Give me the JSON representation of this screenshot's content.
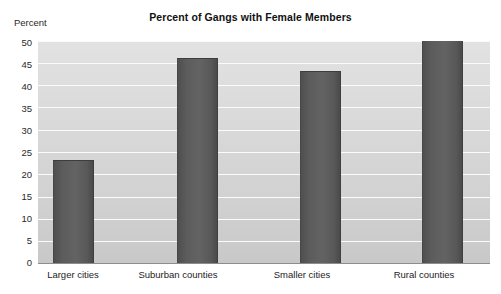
{
  "chart_data": {
    "type": "bar",
    "title": "Percent of Gangs with Female Members",
    "xlabel": "",
    "ylabel": "Percent",
    "categories": [
      "Larger cities",
      "Suburban counties",
      "Smaller cities",
      "Rural counties"
    ],
    "values": [
      23,
      46,
      43,
      50
    ],
    "ylim": [
      0,
      50
    ],
    "ytick_labels": [
      "50",
      "45",
      "40",
      "35",
      "30",
      "25",
      "20",
      "15",
      "10",
      "5",
      "0"
    ],
    "ytick_values": [
      50,
      45,
      40,
      35,
      30,
      25,
      20,
      15,
      10,
      5,
      0
    ],
    "grid": true,
    "legend": false,
    "colors": {
      "bar": "#5a5a5a",
      "plot_background": "#d8d8d8",
      "gridline": "#fbfbfb",
      "axis_line": "#8d8d8d",
      "text": "#1a1a1a"
    }
  }
}
